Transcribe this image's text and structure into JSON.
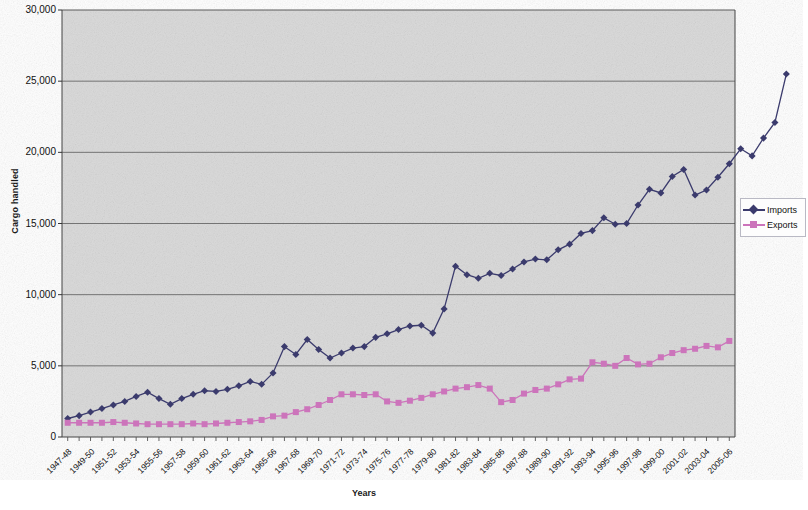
{
  "chart_data": {
    "type": "line",
    "title": "",
    "xlabel": "Years",
    "ylabel": "Cargo handled",
    "ylim": [
      0,
      30000
    ],
    "ytick_labels": [
      "0",
      "5,000",
      "10,000",
      "15,000",
      "20,000",
      "25,000",
      "30,000"
    ],
    "ytick_values": [
      0,
      5000,
      10000,
      15000,
      20000,
      25000,
      30000
    ],
    "grid": true,
    "legend_position": "right",
    "plot_background": "#d8d8d8",
    "categories": [
      "1947-48",
      "1948-49",
      "1949-50",
      "1950-51",
      "1951-52",
      "1952-53",
      "1953-54",
      "1954-55",
      "1955-56",
      "1956-57",
      "1957-58",
      "1958-59",
      "1959-60",
      "1960-61",
      "1961-62",
      "1962-63",
      "1963-64",
      "1964-65",
      "1965-66",
      "1966-67",
      "1967-68",
      "1968-69",
      "1969-70",
      "1970-71",
      "1971-72",
      "1972-73",
      "1973-74",
      "1974-75",
      "1975-76",
      "1976-77",
      "1977-78",
      "1978-79",
      "1979-80",
      "1980-81",
      "1981-82",
      "1982-83",
      "1983-84",
      "1984-85",
      "1985-86",
      "1986-87",
      "1987-88",
      "1988-89",
      "1989-90",
      "1990-91",
      "1991-92",
      "1992-93",
      "1993-94",
      "1994-95",
      "1995-96",
      "1996-97",
      "1997-98",
      "1998-99",
      "1999-00",
      "2000-01",
      "2001-02",
      "2002-03",
      "2003-04",
      "2004-05",
      "2005-06"
    ],
    "tick_label_every": 2,
    "displayed_tick_labels": [
      "1947-48",
      "1949-50",
      "1951-52",
      "1953-54",
      "1955-56",
      "1957-58",
      "1959-60",
      "1961-62",
      "1963-64",
      "1965-66",
      "1967-68",
      "1969-70",
      "1971-72",
      "1973-74",
      "1975-76",
      "1977-78",
      "1979-80",
      "1981-82",
      "1983-84",
      "1985-86",
      "1987-88",
      "1989-90",
      "1991-92",
      "1993-94",
      "1995-96",
      "1997-98",
      "1999-00",
      "2001-02",
      "2003-04",
      "2005-06"
    ],
    "series": [
      {
        "name": "Imports",
        "color": "#3b3b6d",
        "marker": "diamond",
        "values": [
          1300,
          1500,
          1750,
          2000,
          2250,
          2500,
          2850,
          3150,
          2700,
          2300,
          2700,
          3000,
          3250,
          3200,
          3350,
          3600,
          3900,
          3700,
          4500,
          6350,
          5800,
          6850,
          6150,
          5550,
          5900,
          6250,
          6350,
          7000,
          7250,
          7550,
          7800,
          7850,
          7300,
          9000,
          12000,
          11400,
          11150,
          11500,
          11350,
          11800,
          12300,
          12500,
          12450,
          13150,
          13550,
          14300,
          14500,
          15400,
          14950,
          15000,
          16300,
          17400,
          17150,
          18300,
          18800,
          17000,
          17350,
          18250,
          19200
        ],
        "values_tail": [
          20250,
          19750,
          21000,
          22100,
          25500
        ]
      },
      {
        "name": "Exports",
        "color": "#cc74bb",
        "marker": "square",
        "values": [
          1000,
          1000,
          1000,
          1000,
          1050,
          1000,
          950,
          900,
          900,
          900,
          900,
          950,
          900,
          950,
          1000,
          1050,
          1100,
          1200,
          1450,
          1500,
          1750,
          1950,
          2250,
          2600,
          3000,
          3000,
          2950,
          3000,
          2500,
          2400,
          2550,
          2750,
          3000,
          3200,
          3400,
          3500,
          3650,
          3400,
          2450,
          2600,
          3050,
          3300,
          3400,
          3700,
          4050,
          4100,
          5250,
          5150,
          5000,
          5550,
          5100,
          5150,
          5600,
          5900,
          6100,
          6200,
          6400,
          6300,
          6750
        ]
      }
    ]
  },
  "legend": {
    "entries": [
      {
        "label": "Imports",
        "color": "#3b3b6d",
        "marker": "diamond"
      },
      {
        "label": "Exports",
        "color": "#cc74bb",
        "marker": "square"
      }
    ]
  },
  "axes": {
    "y_title": "Cargo handled",
    "x_title": "Years"
  }
}
